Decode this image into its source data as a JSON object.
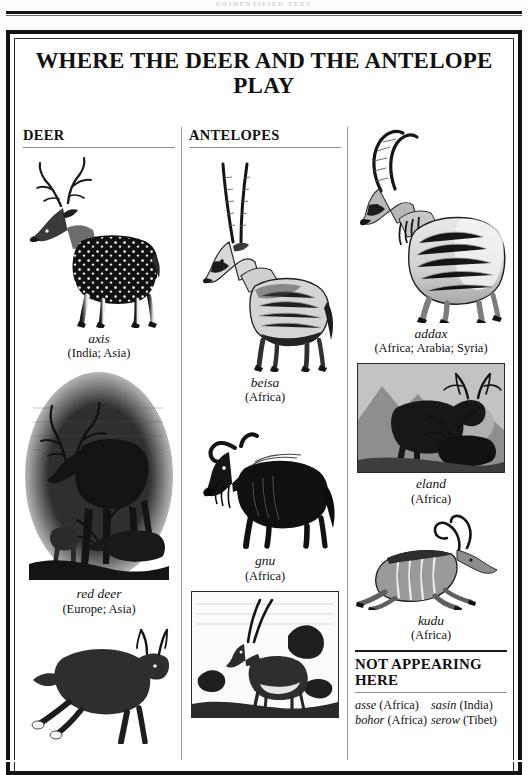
{
  "running_head": "UNIDENTIFIED TEXT",
  "page": {
    "title": "WHERE THE DEER AND THE ANTELOPE PLAY"
  },
  "columns": [
    {
      "heading": "DEER",
      "entries": [
        {
          "name": "axis",
          "region": "(India; Asia)",
          "figure": "axis-deer-engraving"
        },
        {
          "name": "red deer",
          "region": "(Europe; Asia)",
          "figure": "red-deer-engraving"
        },
        {
          "name": "",
          "region": "",
          "figure": "roe-deer-engraving"
        }
      ]
    },
    {
      "heading": "ANTELOPES",
      "entries": [
        {
          "name": "beisa",
          "region": "(Africa)",
          "figure": "beisa-antelope-engraving"
        },
        {
          "name": "gnu",
          "region": "(Africa)",
          "figure": "gnu-engraving"
        },
        {
          "name": "",
          "region": "",
          "figure": "oryx-engraving"
        }
      ]
    },
    {
      "heading": "",
      "entries": [
        {
          "name": "addax",
          "region": "(Africa; Arabia; Syria)",
          "figure": "addax-engraving"
        },
        {
          "name": "eland",
          "region": "(Africa)",
          "figure": "eland-engraving"
        },
        {
          "name": "kudu",
          "region": "(Africa)",
          "figure": "kudu-engraving"
        }
      ]
    }
  ],
  "not_appearing": {
    "heading": "NOT APPEARING HERE",
    "rows": [
      {
        "left_name": "asse",
        "left_region": "(Africa)",
        "right_name": "sasin",
        "right_region": "(India)"
      },
      {
        "left_name": "bohor",
        "left_region": "(Africa)",
        "right_name": "serow",
        "right_region": "(Tibet)"
      }
    ]
  }
}
